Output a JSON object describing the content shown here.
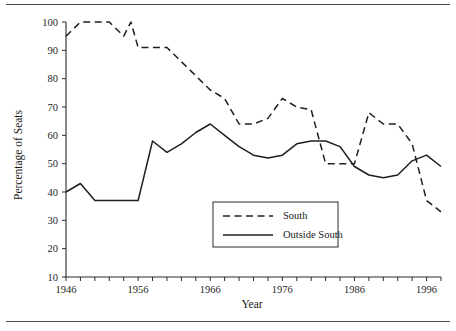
{
  "figure": {
    "name": "percentage-of-seats-by-region-line-chart",
    "has_top_rule": true,
    "has_bottom_rule": true
  },
  "chart_data": {
    "type": "line",
    "title": "",
    "xlabel": "Year",
    "ylabel": "Percentage of Seats",
    "xlim": [
      1946,
      1998
    ],
    "ylim": [
      10,
      100
    ],
    "ytick_step": 10,
    "yticks": [
      10,
      20,
      30,
      40,
      50,
      60,
      70,
      80,
      90,
      100
    ],
    "ytick_labels": [
      "10",
      "20",
      "30",
      "40",
      "50",
      "60",
      "70",
      "80",
      "90",
      "100"
    ],
    "xticks_major": [
      1946,
      1956,
      1966,
      1976,
      1986,
      1996
    ],
    "xtick_labels": [
      "1946",
      "1956",
      "1966",
      "1976",
      "1986",
      "1996"
    ],
    "xtick_minor_step": 2,
    "grid": false,
    "legend_position": "center",
    "x": [
      1946,
      1948,
      1950,
      1952,
      1954,
      1955,
      1956,
      1958,
      1960,
      1962,
      1964,
      1966,
      1968,
      1970,
      1972,
      1974,
      1976,
      1978,
      1980,
      1982,
      1984,
      1986,
      1988,
      1990,
      1992,
      1994,
      1996,
      1998
    ],
    "series": [
      {
        "name": "South",
        "style": "dashed",
        "color": "#1f1f1f",
        "values": [
          95,
          100,
          100,
          100,
          95,
          100,
          91,
          91,
          91,
          86,
          81,
          76,
          73,
          64,
          64,
          66,
          73,
          70,
          69,
          50,
          50,
          50,
          68,
          64,
          64,
          57,
          37,
          33
        ]
      },
      {
        "name": "Outside South",
        "style": "solid",
        "color": "#1f1f1f",
        "values": [
          40,
          43,
          37,
          37,
          37,
          37,
          37,
          58,
          54,
          57,
          61,
          64,
          60,
          56,
          53,
          52,
          53,
          57,
          58,
          58,
          56,
          49,
          46,
          45,
          46,
          51,
          53,
          49
        ]
      }
    ]
  },
  "legend": {
    "entries": [
      {
        "label": "South",
        "style": "dashed"
      },
      {
        "label": "Outside South",
        "style": "solid"
      }
    ]
  }
}
